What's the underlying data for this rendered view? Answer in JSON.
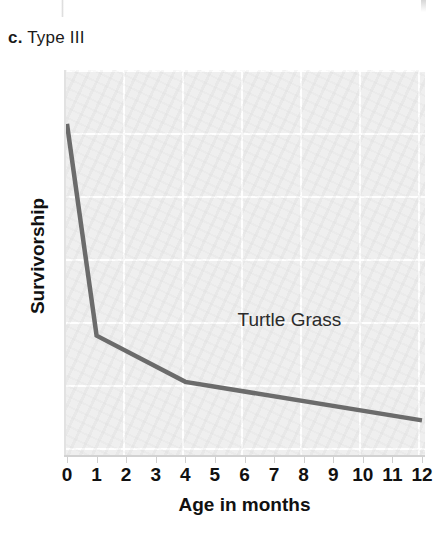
{
  "panel": {
    "letter": "c.",
    "title": "Type III"
  },
  "colors": {
    "line": "#6b6b6b",
    "plot_background": "#efefef",
    "gridline": "#ffffff",
    "axis": "#d2d2d2",
    "text": "#111111"
  },
  "chart_data": {
    "type": "line",
    "title": "Type III",
    "xlabel": "Age in months",
    "ylabel": "Survivorship",
    "xlim": [
      0,
      12
    ],
    "ylim": [
      0,
      100
    ],
    "grid": true,
    "legend_position": "inline-annotation",
    "x_tick_labels": [
      "0",
      "1",
      "2",
      "3",
      "4",
      "5",
      "6",
      "7",
      "8",
      "9",
      "10",
      "11",
      "12"
    ],
    "y_tick_labels": [],
    "annotations": [
      {
        "text": "Turtle Grass",
        "x": 3.6,
        "y": 53
      }
    ],
    "series": [
      {
        "name": "Turtle Grass",
        "color": "#6b6b6b",
        "x": [
          0,
          1,
          4,
          12
        ],
        "values": [
          86,
          31,
          19,
          9
        ]
      }
    ]
  }
}
